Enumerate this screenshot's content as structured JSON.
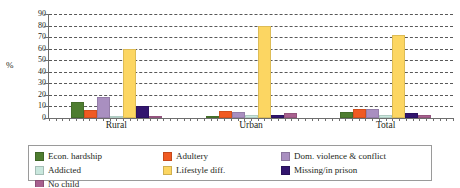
{
  "chart_data": {
    "type": "bar",
    "title": "",
    "xlabel": "",
    "ylabel": "%",
    "ylim": [
      0,
      90
    ],
    "yticks": [
      0,
      10,
      20,
      30,
      40,
      50,
      60,
      70,
      80,
      90
    ],
    "grid": true,
    "legend_position": "bottom",
    "categories": [
      "Rural",
      "Urban",
      "Total"
    ],
    "series": [
      {
        "name": "Econ. hardship",
        "color": "#4e7d30",
        "values": [
          14,
          1,
          5
        ]
      },
      {
        "name": "Adultery",
        "color": "#f05a22",
        "values": [
          7,
          6,
          8
        ]
      },
      {
        "name": "Dom. violence & conflict",
        "color": "#a98fc0",
        "values": [
          18,
          5,
          8
        ]
      },
      {
        "name": "Addicted",
        "color": "#c9e7dd",
        "values": [
          1,
          3,
          3
        ]
      },
      {
        "name": "Lifestyle diff.",
        "color": "#fcd662",
        "values": [
          60,
          80,
          72
        ]
      },
      {
        "name": "Missing/in prison",
        "color": "#32156e",
        "values": [
          10,
          3,
          4
        ]
      },
      {
        "name": "No child",
        "color": "#a8608f",
        "values": [
          1,
          4,
          3
        ]
      }
    ]
  },
  "axis": {
    "ylabel": "%",
    "ytick_labels": [
      "90",
      "80",
      "70",
      "60",
      "50",
      "40",
      "30",
      "20",
      "10",
      "0"
    ]
  },
  "legend": {
    "items": [
      {
        "label": "Econ. hardship",
        "color": "#4e7d30"
      },
      {
        "label": "Adultery",
        "color": "#f05a22"
      },
      {
        "label": "Dom. violence & conflict",
        "color": "#a98fc0"
      },
      {
        "label": "Addicted",
        "color": "#c9e7dd"
      },
      {
        "label": "Lifestyle diff.",
        "color": "#fcd662"
      },
      {
        "label": "Missing/in prison",
        "color": "#32156e"
      },
      {
        "label": "No child",
        "color": "#a8608f"
      }
    ]
  }
}
